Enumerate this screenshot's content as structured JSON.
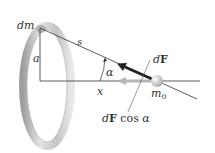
{
  "diagram": {
    "title": "",
    "labels": {
      "dm": "dm",
      "s": "s",
      "a": "a",
      "alpha": "α",
      "x": "x",
      "dF_d": "d",
      "dF_F": "F",
      "m0_m": "m",
      "m0_sub": "0",
      "dFcos_d": "d",
      "dFcos_F": "F",
      "dFcos_cos": " cos ",
      "dFcos_alpha": "α"
    },
    "colors": {
      "ring": "#c9c9c9",
      "ring_shadow": "#a9a9a9",
      "line": "#333333",
      "dF_arrow": "#222222",
      "component_arrow": "#b5b5b5",
      "sphere": "#d9d9d9"
    }
  }
}
